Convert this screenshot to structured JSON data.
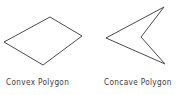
{
  "figure": {
    "background_color": "#ffffff",
    "stroke_color": "#4a4a4a",
    "text_color": "#3c3c3c",
    "width": 181,
    "height": 95,
    "shapes": [
      {
        "name": "convex-polygon",
        "type": "quadrilateral",
        "vertex_count": 4,
        "points": "4,42 50,17 82,36 43,65",
        "caption": "Convex  Polygon"
      },
      {
        "name": "concave-polygon",
        "type": "dart",
        "vertex_count": 4,
        "points": "106,38 164,7 141,37 165,64",
        "caption": "Concave  Polygon"
      }
    ],
    "captions": {
      "convex": "Convex  Polygon",
      "concave": "Concave  Polygon"
    }
  }
}
